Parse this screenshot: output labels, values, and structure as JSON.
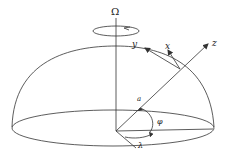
{
  "diagram": {
    "labels": {
      "omega": "Ω",
      "x": "x",
      "y": "y",
      "z": "z",
      "radius": "a",
      "latitude": "φ",
      "longitude": "λ"
    },
    "colors": {
      "stroke": "#333333",
      "background": "#ffffff"
    }
  }
}
